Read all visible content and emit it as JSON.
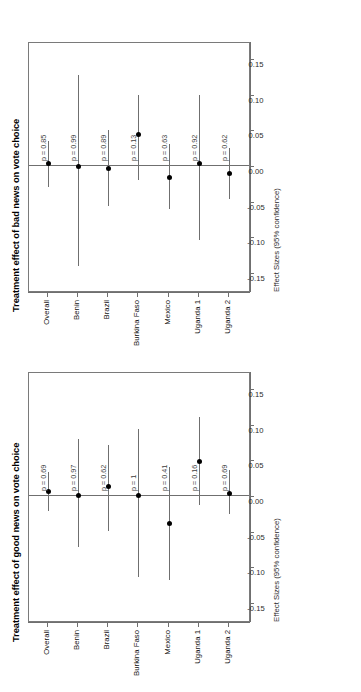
{
  "figure": {
    "orientation": "rotated-90",
    "axis_title": "Effect Sizes (95% confidence)",
    "categories": [
      "Overall",
      "Benin",
      "Brazil",
      "Burkina Faso",
      "Mexico",
      "Uganda 1",
      "Uganda 2"
    ],
    "ticks": [
      "-0.15",
      "-0.10",
      "-0.05",
      "0.00",
      "0.05",
      "0.10",
      "0.15"
    ],
    "tick_values": [
      -0.15,
      -0.1,
      -0.05,
      0.0,
      0.05,
      0.1,
      0.15
    ],
    "colors": {
      "point": "#000000",
      "line": "#6f6f6f",
      "box": "#7a7a7a",
      "text": "#000000"
    }
  },
  "chart_data": [
    {
      "type": "scatter",
      "subtype": "forest-plot",
      "title": "Treatment effect of bad news on vote choice",
      "xlabel": "Effect Sizes (95% confidence)",
      "ylabel": "",
      "xlim": [
        -0.175,
        0.175
      ],
      "grid": false,
      "legend": "none",
      "categories": [
        "Overall",
        "Benin",
        "Brazil",
        "Burkina Faso",
        "Mexico",
        "Uganda 1",
        "Uganda 2"
      ],
      "estimates": [
        0.004,
        -0.001,
        -0.003,
        0.044,
        -0.016,
        0.003,
        -0.01
      ],
      "ci_low": [
        -0.03,
        -0.14,
        -0.056,
        -0.019,
        -0.06,
        -0.104,
        -0.046
      ],
      "ci_high": [
        0.035,
        0.128,
        0.05,
        0.1,
        0.031,
        0.1,
        0.025
      ],
      "p_values": [
        "p = 0.85",
        "p = 0.99",
        "p = 0.89",
        "p = 0.13",
        "p = 0.63",
        "p = 0.92",
        "p = 0.62"
      ]
    },
    {
      "type": "scatter",
      "subtype": "forest-plot",
      "title": "Treatment effect of good news on vote choice",
      "xlabel": "Effect Sizes (95% confidence)",
      "ylabel": "",
      "xlim": [
        -0.175,
        0.175
      ],
      "grid": false,
      "legend": "none",
      "categories": [
        "Overall",
        "Benin",
        "Brazil",
        "Burkina Faso",
        "Mexico",
        "Uganda 1",
        "Uganda 2"
      ],
      "estimates": [
        0.006,
        0.0,
        0.013,
        0.0,
        -0.039,
        0.048,
        0.004
      ],
      "ci_low": [
        -0.021,
        -0.072,
        -0.049,
        -0.114,
        -0.118,
        -0.013,
        -0.025
      ],
      "ci_high": [
        0.033,
        0.08,
        0.072,
        0.094,
        0.04,
        0.11,
        0.036
      ],
      "p_values": [
        "p = 0.69",
        "p = 0.97",
        "p = 0.62",
        "p = 1",
        "p = 0.41",
        "p = 0.16",
        "p = 0.69"
      ]
    }
  ]
}
